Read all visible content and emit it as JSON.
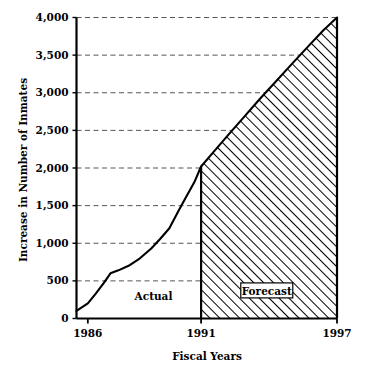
{
  "chart_data": {
    "type": "area",
    "title": "",
    "xlabel": "Fiscal Years",
    "ylabel": "Increase in Number of Inmates",
    "xlim": [
      1985.5,
      1997
    ],
    "ylim": [
      0,
      4000
    ],
    "grid": true,
    "legend_position": "inline-annotations",
    "x_ticks": [
      "1986",
      "1991",
      "1997"
    ],
    "x_tick_values": [
      1986,
      1991,
      1997
    ],
    "y_ticks": [
      "0",
      "500",
      "1,000",
      "1,500",
      "2,000",
      "2,500",
      "3,000",
      "3,500",
      "4,000"
    ],
    "y_tick_values": [
      0,
      500,
      1000,
      1500,
      2000,
      2500,
      3000,
      3500,
      4000
    ],
    "annotations": [
      {
        "label": "Actual",
        "boxed": false,
        "x": 1988.9,
        "y": 300
      },
      {
        "label": "Forecast",
        "boxed": true,
        "x": 1993.9,
        "y": 360
      }
    ],
    "series": [
      {
        "name": "Increase in Number of Inmates",
        "x": [
          1985.5,
          1986.0,
          1986.35,
          1986.7,
          1987.0,
          1987.35,
          1987.8,
          1988.3,
          1988.8,
          1989.2,
          1989.6,
          1990.0,
          1990.35,
          1990.7,
          1991.0
        ],
        "values": [
          100,
          200,
          330,
          470,
          600,
          640,
          700,
          800,
          930,
          1060,
          1200,
          1430,
          1620,
          1810,
          2020
        ],
        "segment": "actual"
      },
      {
        "name": "Forecast",
        "x": [
          1991.0,
          1991.6,
          1992.2,
          1992.9,
          1993.6,
          1994.3,
          1995.0,
          1995.8,
          1996.4,
          1997.0
        ],
        "values": [
          2020,
          2230,
          2440,
          2680,
          2920,
          3150,
          3380,
          3640,
          3830,
          4000
        ],
        "segment": "forecast"
      }
    ],
    "forecast_fill": "diagonal-hatch",
    "forecast_start_year": 1991,
    "colors": {
      "line": "#000000",
      "grid": "#555555",
      "axis": "#000000",
      "hatch": "#000000",
      "background": "#ffffff"
    }
  }
}
